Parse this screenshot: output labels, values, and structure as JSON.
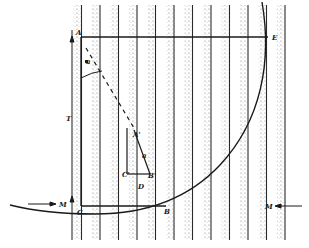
{
  "figure": {
    "colors": {
      "ink": "#1a1a1a",
      "stipple": "#8a8a8a",
      "background": "#ffffff"
    },
    "bands": {
      "count": 12,
      "x_start": 72,
      "spacing": 18.5,
      "top": 5,
      "bottom": 240
    },
    "labels": [
      {
        "id": "A",
        "text": "A",
        "x": 76,
        "y": 29
      },
      {
        "id": "E",
        "text": "E",
        "x": 272,
        "y": 34
      },
      {
        "id": "T",
        "text": "T",
        "x": 66,
        "y": 115
      },
      {
        "id": "C",
        "text": "C",
        "x": 77,
        "y": 209
      },
      {
        "id": "M-left",
        "text": "M",
        "x": 59,
        "y": 201
      },
      {
        "id": "M-right",
        "text": "M",
        "x": 265,
        "y": 203
      },
      {
        "id": "A-prime",
        "text": "A'",
        "x": 133,
        "y": 131
      },
      {
        "id": "B-prime",
        "text": "B'",
        "x": 148,
        "y": 172
      },
      {
        "id": "C-prime",
        "text": "C'",
        "x": 122,
        "y": 171
      },
      {
        "id": "D",
        "text": "D",
        "x": 138,
        "y": 183
      },
      {
        "id": "a",
        "text": "a",
        "x": 142,
        "y": 152
      },
      {
        "id": "B",
        "text": "B",
        "x": 164,
        "y": 208
      },
      {
        "id": "small-a",
        "text": "a",
        "x": 86,
        "y": 58
      }
    ]
  }
}
